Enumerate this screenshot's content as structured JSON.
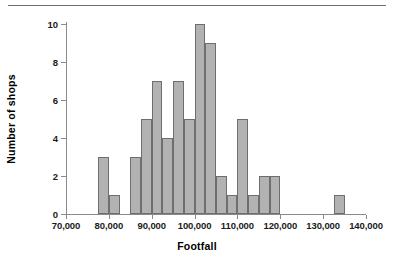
{
  "chart_data": {
    "type": "bar",
    "title": "",
    "subtitle": "",
    "xlabel": "Footfall",
    "ylabel": "Number of shops",
    "xlim": [
      70000,
      140000
    ],
    "ylim": [
      0,
      10
    ],
    "bin_width": 2500,
    "grid": false,
    "legend": null,
    "xtick_labels": [
      "70,000",
      "80,000",
      "90,000",
      "100,000",
      "110,000",
      "120,000",
      "130,000",
      "140,000"
    ],
    "xtick_values": [
      70000,
      80000,
      90000,
      100000,
      110000,
      120000,
      130000,
      140000
    ],
    "ytick_labels": [
      "0",
      "2",
      "4",
      "6",
      "8",
      "10"
    ],
    "ytick_values": [
      0,
      2,
      4,
      6,
      8,
      10
    ],
    "bins": [
      {
        "start": 77500,
        "end": 80000,
        "count": 3
      },
      {
        "start": 80000,
        "end": 82500,
        "count": 1
      },
      {
        "start": 85000,
        "end": 87500,
        "count": 3
      },
      {
        "start": 87500,
        "end": 90000,
        "count": 5
      },
      {
        "start": 90000,
        "end": 92500,
        "count": 7
      },
      {
        "start": 92500,
        "end": 95000,
        "count": 4
      },
      {
        "start": 95000,
        "end": 97500,
        "count": 7
      },
      {
        "start": 97500,
        "end": 100000,
        "count": 5
      },
      {
        "start": 100000,
        "end": 102500,
        "count": 10
      },
      {
        "start": 102500,
        "end": 105000,
        "count": 9
      },
      {
        "start": 105000,
        "end": 107500,
        "count": 2
      },
      {
        "start": 107500,
        "end": 110000,
        "count": 1
      },
      {
        "start": 110000,
        "end": 112500,
        "count": 5
      },
      {
        "start": 112500,
        "end": 115000,
        "count": 1
      },
      {
        "start": 115000,
        "end": 117500,
        "count": 2
      },
      {
        "start": 117500,
        "end": 120000,
        "count": 2
      },
      {
        "start": 132500,
        "end": 135000,
        "count": 1
      }
    ],
    "colors": {
      "bar_fill": "#b2b2b2",
      "bar_border": "#6e6e6e",
      "axis": "#8a8a8a",
      "text": "#000000",
      "rule": "#6f6f6f",
      "background": "#ffffff"
    }
  }
}
